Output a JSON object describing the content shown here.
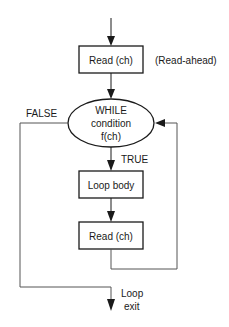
{
  "diagram": {
    "type": "flowchart",
    "nodes": {
      "read_initial": {
        "label": "Read (ch)",
        "shape": "rectangle"
      },
      "read_ahead_note": {
        "label": "(Read-ahead)"
      },
      "while_condition": {
        "line1": "WHILE",
        "line2": "condition",
        "line3": "f(ch)",
        "shape": "ellipse"
      },
      "loop_body": {
        "label": "Loop body",
        "shape": "rectangle"
      },
      "read_loop": {
        "label": "Read (ch)",
        "shape": "rectangle"
      }
    },
    "edge_labels": {
      "false": "FALSE",
      "true": "TRUE",
      "exit_line1": "Loop",
      "exit_line2": "exit"
    },
    "edges": [
      {
        "from": "entry",
        "to": "read_initial"
      },
      {
        "from": "read_initial",
        "to": "while_condition"
      },
      {
        "from": "while_condition",
        "to": "loop_body",
        "label": "TRUE"
      },
      {
        "from": "loop_body",
        "to": "read_loop"
      },
      {
        "from": "read_loop",
        "to": "while_condition",
        "note": "loop back"
      },
      {
        "from": "while_condition",
        "to": "exit",
        "label": "FALSE"
      }
    ],
    "colors": {
      "stroke": "#1a1a1a",
      "connector": "#555555",
      "background": "#ffffff"
    }
  }
}
